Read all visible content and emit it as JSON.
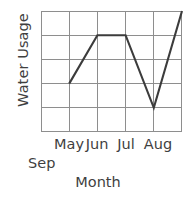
{
  "chart_data": {
    "type": "line",
    "title": "",
    "xlabel": "Month",
    "ylabel": "Water Usage",
    "categories": [
      "May",
      "Jun",
      "Jul",
      "Aug",
      "Sep"
    ],
    "tick_labels": [
      "May",
      "Jun",
      "Jul",
      "Aug",
      "Sep"
    ],
    "values": [
      2,
      4,
      4,
      1,
      5
    ],
    "series": [
      {
        "name": "Water Usage",
        "values": [
          2,
          4,
          4,
          1,
          5
        ]
      }
    ],
    "xlim": [
      0,
      5
    ],
    "ylim": [
      0,
      5
    ],
    "y_gridlines": [
      0,
      1,
      2,
      3,
      4,
      5
    ],
    "x_gridlines": [
      0,
      1,
      2,
      3,
      4,
      5
    ],
    "grid": true,
    "y_tick_labels_shown": false,
    "legend": false,
    "legend_position": "none",
    "line_color": "#3c3c3c",
    "grid_color": "#8e8e8e",
    "background_color": "#ffffff",
    "points": [
      {
        "label": "May",
        "x": 1,
        "y": 2
      },
      {
        "label": "Jun",
        "x": 2,
        "y": 4
      },
      {
        "label": "Jul",
        "x": 3,
        "y": 4
      },
      {
        "label": "Aug",
        "x": 4,
        "y": 1
      },
      {
        "label": "Sep",
        "x": 5,
        "y": 5
      }
    ]
  },
  "axis": {
    "ylabel": "Water Usage",
    "xlabel": "Month"
  },
  "xticks": {
    "t0": "May",
    "t1": "Jun",
    "t2": "Jul",
    "t3": "Aug",
    "t4": "Sep"
  }
}
